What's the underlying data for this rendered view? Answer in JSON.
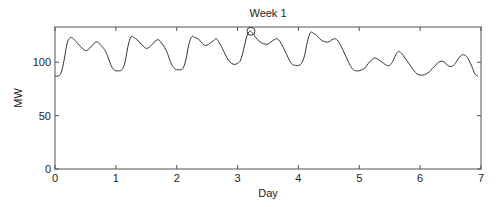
{
  "chart_data": {
    "type": "line",
    "title": "Week 1",
    "xlabel": "Day",
    "ylabel": "MW",
    "xlim": [
      0,
      7
    ],
    "ylim": [
      0,
      133
    ],
    "xticks": [
      0,
      1,
      2,
      3,
      4,
      5,
      6,
      7
    ],
    "yticks": [
      0,
      50,
      100
    ],
    "grid": false,
    "legend": null,
    "series": [
      {
        "name": "Load",
        "x": [
          0.0,
          0.05,
          0.1,
          0.15,
          0.2,
          0.25,
          0.3,
          0.35,
          0.4,
          0.45,
          0.5,
          0.55,
          0.6,
          0.65,
          0.7,
          0.75,
          0.8,
          0.85,
          0.9,
          0.95,
          1.0,
          1.05,
          1.1,
          1.15,
          1.2,
          1.25,
          1.3,
          1.35,
          1.4,
          1.45,
          1.5,
          1.55,
          1.6,
          1.65,
          1.7,
          1.75,
          1.8,
          1.85,
          1.9,
          1.95,
          2.0,
          2.05,
          2.1,
          2.15,
          2.2,
          2.25,
          2.3,
          2.35,
          2.4,
          2.45,
          2.5,
          2.55,
          2.6,
          2.65,
          2.7,
          2.75,
          2.8,
          2.85,
          2.9,
          2.95,
          3.0,
          3.05,
          3.1,
          3.15,
          3.2,
          3.25,
          3.3,
          3.35,
          3.4,
          3.45,
          3.5,
          3.55,
          3.6,
          3.65,
          3.7,
          3.75,
          3.8,
          3.85,
          3.9,
          3.95,
          4.0,
          4.05,
          4.1,
          4.15,
          4.2,
          4.25,
          4.3,
          4.35,
          4.4,
          4.45,
          4.5,
          4.55,
          4.6,
          4.65,
          4.7,
          4.75,
          4.8,
          4.85,
          4.9,
          4.95,
          5.0,
          5.05,
          5.1,
          5.15,
          5.2,
          5.25,
          5.3,
          5.35,
          5.4,
          5.45,
          5.5,
          5.55,
          5.6,
          5.65,
          5.7,
          5.75,
          5.8,
          5.85,
          5.9,
          5.95,
          6.0,
          6.05,
          6.1,
          6.15,
          6.2,
          6.25,
          6.3,
          6.35,
          6.4,
          6.45,
          6.5,
          6.55,
          6.6,
          6.65,
          6.7,
          6.75,
          6.8,
          6.85,
          6.9,
          6.95
        ],
        "y": [
          87,
          87,
          90,
          102,
          118,
          123,
          122,
          119,
          116,
          113,
          111,
          112,
          115,
          118,
          119,
          116,
          113,
          108,
          100,
          94,
          92,
          92,
          93,
          100,
          115,
          124,
          123,
          121,
          118,
          115,
          113,
          114,
          117,
          120,
          121,
          118,
          114,
          108,
          100,
          95,
          93,
          93,
          94,
          102,
          117,
          124,
          123,
          122,
          119,
          116,
          116,
          118,
          120,
          122,
          118,
          113,
          107,
          102,
          99,
          98,
          99,
          102,
          112,
          124,
          129,
          127,
          123,
          120,
          118,
          117,
          117,
          119,
          121,
          122,
          119,
          114,
          108,
          102,
          98,
          97,
          97,
          99,
          106,
          120,
          128,
          127,
          125,
          122,
          120,
          119,
          119,
          121,
          122,
          120,
          115,
          109,
          103,
          97,
          93,
          92,
          92,
          93,
          95,
          99,
          102,
          104,
          103,
          101,
          99,
          97,
          97,
          101,
          107,
          110,
          108,
          104,
          100,
          96,
          92,
          89,
          88,
          88,
          89,
          91,
          94,
          97,
          100,
          101,
          100,
          97,
          96,
          97,
          101,
          105,
          107,
          106,
          102,
          96,
          89,
          87
        ]
      }
    ],
    "annotations": [
      {
        "type": "circle-marker",
        "x": 3.22,
        "y": 129,
        "label": "peak"
      }
    ]
  },
  "text": {
    "title": "Week 1",
    "xlabel": "Day",
    "ylabel": "MW",
    "xtick_labels": [
      "0",
      "1",
      "2",
      "3",
      "4",
      "5",
      "6",
      "7"
    ],
    "ytick_labels": [
      "0",
      "50",
      "100"
    ]
  }
}
